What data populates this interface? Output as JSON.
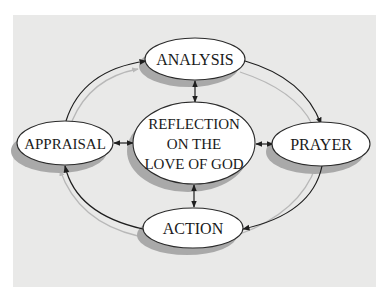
{
  "diagram": {
    "type": "cycle",
    "colors": {
      "background": "#ffffff",
      "panel": "#e9e9e8",
      "node_fill": "#ffffff",
      "node_stroke": "#2a2a2a",
      "shadow": "#a9a9a9",
      "arrow": "#1e1e1e",
      "arrow_shadow": "#b8b8b8"
    },
    "center_node": {
      "id": "reflection",
      "lines": [
        "REFLECTION",
        "ON THE",
        "LOVE OF GOD"
      ]
    },
    "nodes": [
      {
        "id": "analysis",
        "label": "ANALYSIS",
        "position": "top"
      },
      {
        "id": "prayer",
        "label": "PRAYER",
        "position": "right"
      },
      {
        "id": "action",
        "label": "ACTION",
        "position": "bottom"
      },
      {
        "id": "appraisal",
        "label": "APPRAISAL",
        "position": "left"
      }
    ],
    "cycle_edges": [
      {
        "from": "appraisal",
        "to": "analysis",
        "style": "curved-arrow"
      },
      {
        "from": "analysis",
        "to": "prayer",
        "style": "curved-arrow"
      },
      {
        "from": "prayer",
        "to": "action",
        "style": "curved-arrow"
      },
      {
        "from": "action",
        "to": "appraisal",
        "style": "curved-arrow"
      }
    ],
    "spoke_edges": [
      {
        "between": [
          "reflection",
          "analysis"
        ],
        "style": "double-arrow"
      },
      {
        "between": [
          "reflection",
          "prayer"
        ],
        "style": "double-arrow"
      },
      {
        "between": [
          "reflection",
          "action"
        ],
        "style": "double-arrow"
      },
      {
        "between": [
          "reflection",
          "appraisal"
        ],
        "style": "double-arrow"
      }
    ]
  }
}
